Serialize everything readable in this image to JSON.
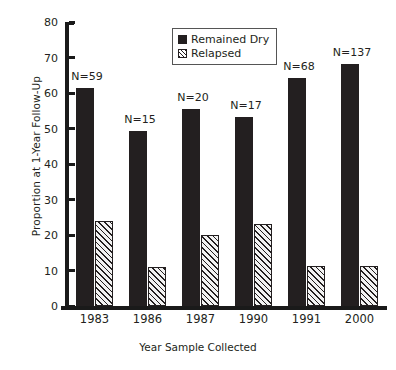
{
  "chart_data": {
    "type": "bar",
    "title": "",
    "xlabel": "Year Sample Collected",
    "ylabel": "Proportion at 1-Year Follow-Up",
    "categories": [
      "1983",
      "1986",
      "1987",
      "1990",
      "1991",
      "2000"
    ],
    "series": [
      {
        "name": "Remained Dry",
        "values": [
          61.5,
          49.2,
          55.4,
          53.3,
          64.2,
          68.2
        ]
      },
      {
        "name": "Relapsed",
        "values": [
          23.9,
          11.1,
          20.1,
          23.1,
          11.3,
          11.3
        ]
      }
    ],
    "annotations": [
      "N=59",
      "N=15",
      "N=20",
      "N=17",
      "N=68",
      "N=137"
    ],
    "ylim": [
      0,
      80
    ],
    "yticks": [
      0,
      10,
      20,
      30,
      40,
      50,
      60,
      70,
      80
    ],
    "ytick_labels": [
      "0",
      "10",
      "20",
      "30",
      "40",
      "50",
      "60",
      "70",
      "80"
    ],
    "grid": false,
    "legend_position": "upper center",
    "colors": {
      "remained_dry": "#231f20",
      "relapsed_hatch": "#231f20",
      "axis": "#1a1a1a"
    }
  },
  "legend": {
    "items": [
      {
        "label": "Remained Dry",
        "swatch": "solid-black-square-icon"
      },
      {
        "label": "Relapsed",
        "swatch": "hatched-square-icon"
      }
    ]
  }
}
